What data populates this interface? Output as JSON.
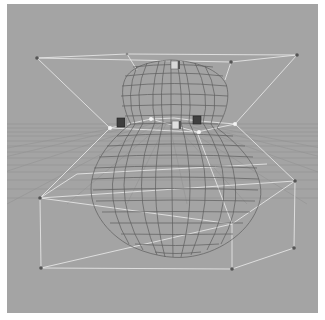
{
  "viewport": {
    "label": "3D perspective viewport",
    "background": "#a4a4a4",
    "grid_color": "#8e8e8e",
    "wire_color": "#5a5a5a",
    "lattice_color": "#e6e6e6"
  },
  "object": {
    "name": "gourd-wireframe-mesh",
    "shape": "gourd"
  },
  "deformer": {
    "name": "lattice-deformer",
    "handles": [
      {
        "name": "handle-top-center",
        "shade": "light"
      },
      {
        "name": "handle-mid-left",
        "shade": "dark"
      },
      {
        "name": "handle-mid-center",
        "shade": "light"
      },
      {
        "name": "handle-mid-right",
        "shade": "dark"
      }
    ]
  }
}
